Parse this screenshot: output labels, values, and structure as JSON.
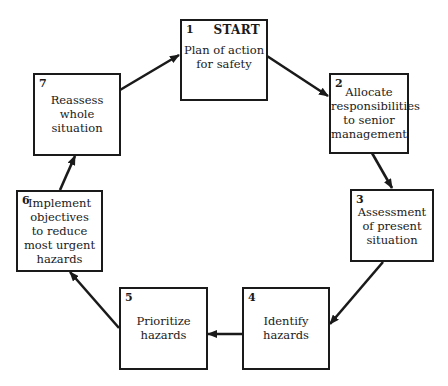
{
  "diagram": {
    "type": "cycle-flowchart",
    "start_label": "START",
    "steps": [
      {
        "number": "1",
        "text": "Plan of action\nfor safety"
      },
      {
        "number": "2",
        "text": "Allocate\nresponsibilities\nto senior\nmanagement"
      },
      {
        "number": "3",
        "text": "Assessment\nof present\nsituation"
      },
      {
        "number": "4",
        "text": "Identify\nhazards"
      },
      {
        "number": "5",
        "text": "Prioritize\nhazards"
      },
      {
        "number": "6",
        "text": "Implement\nobjectives\nto reduce\nmost urgent\nhazards"
      },
      {
        "number": "7",
        "text": "Reassess\nwhole\nsituation"
      }
    ],
    "flow": [
      "1→2",
      "2→3",
      "3→4",
      "4→5",
      "5→6",
      "6→7",
      "7→1"
    ],
    "colors": {
      "line": "#1a1a1a",
      "background": "#ffffff"
    }
  }
}
